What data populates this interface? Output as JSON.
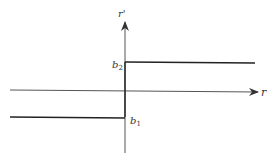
{
  "diagram": {
    "type": "step-function",
    "axes": {
      "x_label": "r",
      "y_label": "r'"
    },
    "levels": [
      {
        "name": "b1",
        "base": "b",
        "subscript": "1",
        "domain": "r < 0"
      },
      {
        "name": "b2",
        "base": "b",
        "subscript": "2",
        "domain": "r > 0"
      }
    ],
    "colors": {
      "axis": "#555555",
      "line": "#222222",
      "background": "#ffffff"
    }
  }
}
